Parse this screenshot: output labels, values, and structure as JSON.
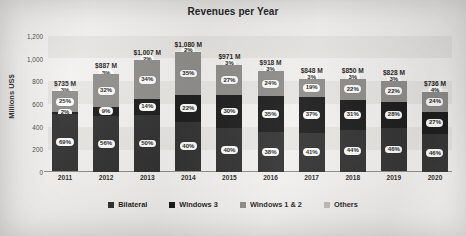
{
  "chart_data": {
    "type": "bar",
    "subtype": "stacked-percentage",
    "title": "Revenues per Year",
    "xlabel": "",
    "ylabel": "Millions US$",
    "ylim": [
      0,
      1200
    ],
    "yticks": [
      "1,200",
      "1,000",
      "800",
      "600",
      "400",
      "200",
      "0"
    ],
    "ytick_values": [
      1200,
      1000,
      800,
      600,
      400,
      200,
      0
    ],
    "grid": false,
    "legend_position": "bottom",
    "categories": [
      "2011",
      "2012",
      "2013",
      "2014",
      "2015",
      "2016",
      "2017",
      "2018",
      "2019",
      "2020"
    ],
    "totals": [
      735,
      887,
      1007,
      1080,
      971,
      918,
      848,
      850,
      828,
      736
    ],
    "total_labels": [
      "$735 M",
      "$887 M",
      "$1,007 M",
      "$1,080 M",
      "$971 M",
      "$918 M",
      "$848 M",
      "$850 M",
      "$828 M",
      "$736 M"
    ],
    "series": [
      {
        "name": "Bilateral",
        "color": "#2c2c2c",
        "values": [
          69,
          56,
          50,
          40,
          40,
          38,
          41,
          44,
          46,
          46
        ],
        "labels": [
          "69%",
          "56%",
          "50%",
          "40%",
          "40%",
          "38%",
          "41%",
          "44%",
          "46%",
          "46%"
        ]
      },
      {
        "name": "Windows 3",
        "color": "#151515",
        "values": [
          2,
          9,
          14,
          22,
          30,
          35,
          37,
          31,
          28,
          27
        ],
        "labels": [
          "2%",
          "9%",
          "14%",
          "22%",
          "30%",
          "35%",
          "37%",
          "31%",
          "28%",
          "27%"
        ]
      },
      {
        "name": "Windows 1 & 2",
        "color": "#8b8a87",
        "values": [
          25,
          32,
          34,
          35,
          27,
          24,
          19,
          22,
          22,
          24
        ],
        "labels": [
          "25%",
          "32%",
          "34%",
          "35%",
          "27%",
          "24%",
          "19%",
          "22%",
          "22%",
          "24%"
        ]
      },
      {
        "name": "Others",
        "color": "#bdbcb9",
        "values": [
          3,
          3,
          2,
          2,
          3,
          3,
          3,
          3,
          3,
          4
        ],
        "labels": [
          "3%",
          "3%",
          "2%",
          "2%",
          "3%",
          "3%",
          "3%",
          "3%",
          "3%",
          "4%"
        ]
      }
    ]
  }
}
